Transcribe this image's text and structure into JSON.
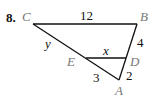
{
  "problem": {
    "number": "8."
  },
  "points": {
    "C": {
      "label": "C",
      "x": 33,
      "y": 24
    },
    "B": {
      "label": "B",
      "x": 137,
      "y": 24
    },
    "A": {
      "label": "A",
      "x": 119,
      "y": 80
    },
    "D": {
      "label": "D",
      "x": 126,
      "y": 58
    },
    "E": {
      "label": "E",
      "x": 86,
      "y": 58
    }
  },
  "segments": {
    "CB": {
      "label": "12"
    },
    "BD": {
      "label": "4"
    },
    "DA": {
      "label": "2"
    },
    "EA": {
      "label": "3"
    },
    "CE": {
      "label": "y"
    },
    "ED": {
      "label": "x"
    }
  },
  "colors": {
    "line": "#111111",
    "vertex_label": "#777777"
  }
}
